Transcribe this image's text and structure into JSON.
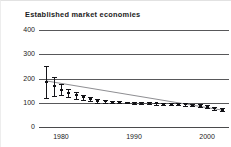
{
  "figure": {
    "title": "Established market economies",
    "background_color": "#ffffff",
    "axis_color": "#58585a",
    "marker_color": "#15151a",
    "trend_color": "#8a8a8e"
  },
  "chart_data": {
    "type": "line",
    "title": "Established market economies",
    "xlabel": "",
    "ylabel": "",
    "xlim": [
      1977,
      2003
    ],
    "ylim": [
      0,
      400
    ],
    "yticks": [
      0,
      100,
      200,
      300,
      400
    ],
    "ytick_labels": [
      "0",
      "100",
      "200",
      "300",
      "400"
    ],
    "xticks": [
      1980,
      1990,
      2000
    ],
    "xtick_labels": [
      "1980",
      "1990",
      "2000"
    ],
    "grid": true,
    "grid_axis": "y",
    "legend": false,
    "series": [
      {
        "name": "Established market economies",
        "marker": "point-with-error-bars",
        "x": [
          1978,
          1979,
          1980,
          1981,
          1982,
          1983,
          1984,
          1985,
          1986,
          1987,
          1988,
          1989,
          1990,
          1991,
          1992,
          1993,
          1994,
          1995,
          1996,
          1997,
          1998,
          1999,
          2000,
          2001,
          2002
        ],
        "values": [
          185,
          168,
          152,
          140,
          130,
          122,
          114,
          108,
          106,
          104,
          103,
          101,
          100,
          99,
          98,
          97,
          96,
          95,
          94,
          93,
          91,
          88,
          84,
          78,
          72
        ],
        "err_low": [
          120,
          128,
          130,
          122,
          115,
          110,
          106,
          101,
          100,
          99,
          98,
          97,
          95,
          94,
          93,
          92,
          91,
          90,
          89,
          88,
          86,
          83,
          78,
          72,
          65
        ],
        "err_high": [
          250,
          207,
          176,
          158,
          146,
          134,
          122,
          115,
          112,
          109,
          108,
          105,
          104,
          103,
          102,
          101,
          100,
          100,
          99,
          98,
          96,
          93,
          90,
          84,
          79
        ]
      }
    ],
    "trend_line": {
      "name": "fitted-trend",
      "x": [
        1978,
        2002
      ],
      "values": [
        190,
        70
      ]
    }
  }
}
